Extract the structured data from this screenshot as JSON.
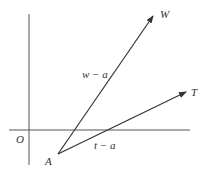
{
  "diagram": {
    "origin_label": "O",
    "point_a_label": "A",
    "point_w_label": "W",
    "point_t_label": "T",
    "vector_w_minus_a_label": "w − a",
    "vector_t_minus_a_label": "t − a",
    "stroke_color": "#333333"
  }
}
